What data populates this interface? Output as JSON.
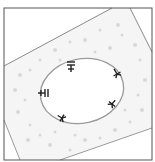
{
  "figure": {
    "panel_label": "",
    "frame": {
      "x": 4,
      "y": 8,
      "width": 148,
      "height": 152,
      "stroke": "#555555"
    },
    "colors": {
      "background": "#ffffff",
      "tissue_fill": "#f4f4f4",
      "tissue_dots": "#d6d6d6",
      "outline": "#8a8a8a",
      "ellipse": "#9a9a9a",
      "marker": "#222222"
    },
    "tissue_region": {
      "points": "4,66 112,8 130,8 152,52 152,128 60,160 20,160 4,120"
    },
    "ellipse": {
      "cx": 82,
      "cy": 91,
      "rx": 42,
      "ry": 33,
      "rotate": -12
    },
    "markers": [
      {
        "name": "marker-top",
        "x": 71,
        "y": 66,
        "rotate": 0
      },
      {
        "name": "marker-upper-right",
        "x": 117,
        "y": 74,
        "rotate": -30
      },
      {
        "name": "marker-left",
        "x": 42,
        "y": 93,
        "rotate": 90
      },
      {
        "name": "marker-right",
        "x": 112,
        "y": 104,
        "rotate": 40
      },
      {
        "name": "marker-bottom-left",
        "x": 62,
        "y": 120,
        "rotate": -60
      }
    ]
  }
}
